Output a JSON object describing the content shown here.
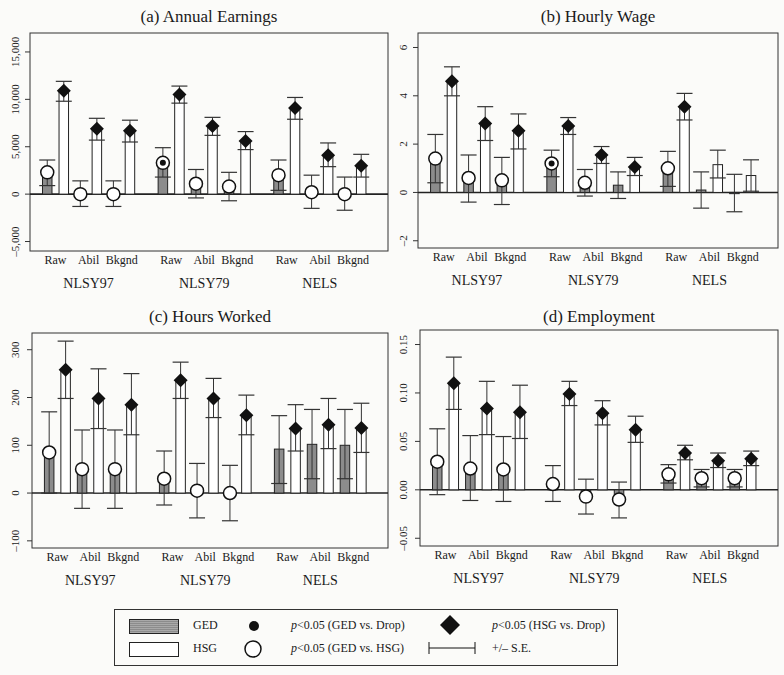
{
  "chart_data": [
    {
      "type": "bar",
      "title": "(a) Annual Earnings",
      "ylabel": "",
      "ylim": [
        -6000,
        17000
      ],
      "yticks": [
        -5000,
        0,
        5000,
        10000,
        15000
      ],
      "ytick_labels": [
        "-5,000",
        "0",
        "5,000",
        "10,000",
        "15,000"
      ],
      "groups": [
        "NLSY97",
        "NLSY79",
        "NELS"
      ],
      "categories": [
        "Raw",
        "Abil",
        "Bkgnd"
      ],
      "series": [
        {
          "name": "GED",
          "values": [
            [
              2300,
              0,
              0
            ],
            [
              3300,
              1100,
              800
            ],
            [
              2000,
              200,
              0
            ]
          ],
          "se_low": [
            [
              900,
              -1300,
              -1300
            ],
            [
              1800,
              -400,
              -700
            ],
            [
              400,
              -1500,
              -1700
            ]
          ],
          "se_high": [
            [
              3600,
              1400,
              1400
            ],
            [
              4900,
              2600,
              2300
            ],
            [
              3600,
              2000,
              1800
            ]
          ],
          "marker": [
            [
              "circle",
              "circle",
              "circle"
            ],
            [
              "dot",
              "circle",
              "circle"
            ],
            [
              "circle",
              "circle",
              "circle"
            ]
          ]
        },
        {
          "name": "HSG",
          "values": [
            [
              10900,
              6900,
              6700
            ],
            [
              10500,
              7200,
              5600
            ],
            [
              9100,
              4100,
              3000
            ]
          ],
          "se_low": [
            [
              9800,
              5700,
              5500
            ],
            [
              9600,
              6200,
              4700
            ],
            [
              7900,
              2900,
              1800
            ]
          ],
          "se_high": [
            [
              11900,
              8000,
              7800
            ],
            [
              11400,
              8100,
              6600
            ],
            [
              10200,
              5400,
              4200
            ]
          ],
          "marker": [
            [
              "diamond",
              "diamond",
              "diamond"
            ],
            [
              "diamond",
              "diamond",
              "diamond"
            ],
            [
              "diamond",
              "diamond",
              "diamond"
            ]
          ]
        }
      ]
    },
    {
      "type": "bar",
      "title": "(b) Hourly Wage",
      "ylabel": "",
      "ylim": [
        -2.3,
        6.6
      ],
      "yticks": [
        -2,
        0,
        2,
        4,
        6
      ],
      "ytick_labels": [
        "-2",
        "0",
        "2",
        "4",
        "6"
      ],
      "groups": [
        "NLSY97",
        "NLSY79",
        "NELS"
      ],
      "categories": [
        "Raw",
        "Abil",
        "Bkgnd"
      ],
      "series": [
        {
          "name": "GED",
          "values": [
            [
              1.4,
              0.6,
              0.5
            ],
            [
              1.2,
              0.4,
              0.3
            ],
            [
              1.0,
              0.1,
              -0.05
            ]
          ],
          "se_low": [
            [
              0.4,
              -0.4,
              -0.5
            ],
            [
              0.65,
              -0.15,
              -0.25
            ],
            [
              0.25,
              -0.65,
              -0.8
            ]
          ],
          "se_high": [
            [
              2.4,
              1.55,
              1.45
            ],
            [
              1.75,
              0.95,
              0.85
            ],
            [
              1.7,
              0.85,
              0.75
            ]
          ],
          "marker": [
            [
              "circle",
              "circle",
              "circle"
            ],
            [
              "dot",
              "circle",
              "none"
            ],
            [
              "circle",
              "none",
              "none"
            ]
          ]
        },
        {
          "name": "HSG",
          "values": [
            [
              4.6,
              2.85,
              2.55
            ],
            [
              2.75,
              1.55,
              1.05
            ],
            [
              3.55,
              1.15,
              0.7
            ]
          ],
          "se_low": [
            [
              4.0,
              2.15,
              1.8
            ],
            [
              2.4,
              1.2,
              0.7
            ],
            [
              3.0,
              0.6,
              0.05
            ]
          ],
          "se_high": [
            [
              5.2,
              3.55,
              3.25
            ],
            [
              3.1,
              1.9,
              1.45
            ],
            [
              4.1,
              1.75,
              1.35
            ]
          ],
          "marker": [
            [
              "diamond",
              "diamond",
              "diamond"
            ],
            [
              "diamond",
              "diamond",
              "diamond"
            ],
            [
              "diamond",
              "none",
              "none"
            ]
          ]
        }
      ]
    },
    {
      "type": "bar",
      "title": "(c) Hours Worked",
      "ylabel": "",
      "ylim": [
        -115,
        335
      ],
      "yticks": [
        -100,
        0,
        100,
        200,
        300
      ],
      "ytick_labels": [
        "-100",
        "0",
        "100",
        "200",
        "300"
      ],
      "groups": [
        "NLSY97",
        "NLSY79",
        "NELS"
      ],
      "categories": [
        "Raw",
        "Abil",
        "Bkgnd"
      ],
      "series": [
        {
          "name": "GED",
          "values": [
            [
              85,
              50,
              50
            ],
            [
              30,
              5,
              0
            ],
            [
              92,
              102,
              100
            ]
          ],
          "se_low": [
            [
              0,
              -32,
              -32
            ],
            [
              -25,
              -52,
              -58
            ],
            [
              20,
              30,
              30
            ]
          ],
          "se_high": [
            [
              170,
              132,
              132
            ],
            [
              88,
              62,
              58
            ],
            [
              162,
              175,
              175
            ]
          ],
          "marker": [
            [
              "circle",
              "circle",
              "circle"
            ],
            [
              "circle",
              "circle",
              "circle"
            ],
            [
              "none",
              "none",
              "none"
            ]
          ]
        },
        {
          "name": "HSG",
          "values": [
            [
              258,
              198,
              185
            ],
            [
              236,
              198,
              163
            ],
            [
              135,
              143,
              136
            ]
          ],
          "se_low": [
            [
              198,
              135,
              122
            ],
            [
              198,
              158,
              122
            ],
            [
              88,
              93,
              85
            ]
          ],
          "se_high": [
            [
              318,
              260,
              250
            ],
            [
              274,
              240,
              205
            ],
            [
              185,
              198,
              188
            ]
          ],
          "marker": [
            [
              "diamond",
              "diamond",
              "diamond"
            ],
            [
              "diamond",
              "diamond",
              "diamond"
            ],
            [
              "diamond",
              "diamond",
              "diamond"
            ]
          ]
        }
      ]
    },
    {
      "type": "bar",
      "title": "(d) Employment",
      "ylabel": "",
      "ylim": [
        -0.058,
        0.165
      ],
      "yticks": [
        -0.05,
        0.0,
        0.05,
        0.1,
        0.15
      ],
      "ytick_labels": [
        "-0.05",
        "0.00",
        "0.05",
        "0.10",
        "0.15"
      ],
      "groups": [
        "NLSY97",
        "NLSY79",
        "NELS"
      ],
      "categories": [
        "Raw",
        "Abil",
        "Bkgnd"
      ],
      "series": [
        {
          "name": "GED",
          "values": [
            [
              0.029,
              0.022,
              0.021
            ],
            [
              0.006,
              -0.007,
              -0.01
            ],
            [
              0.016,
              0.012,
              0.012
            ]
          ],
          "se_low": [
            [
              -0.005,
              -0.011,
              -0.012
            ],
            [
              -0.012,
              -0.025,
              -0.029
            ],
            [
              0.007,
              0.003,
              0.003
            ]
          ],
          "se_high": [
            [
              0.063,
              0.056,
              0.055
            ],
            [
              0.025,
              0.011,
              0.008
            ],
            [
              0.026,
              0.021,
              0.021
            ]
          ],
          "marker": [
            [
              "circle",
              "circle",
              "circle"
            ],
            [
              "circle",
              "circle",
              "circle"
            ],
            [
              "circle",
              "circle",
              "circle"
            ]
          ]
        },
        {
          "name": "HSG",
          "values": [
            [
              0.11,
              0.084,
              0.08
            ],
            [
              0.099,
              0.079,
              0.062
            ],
            [
              0.038,
              0.03,
              0.032
            ]
          ],
          "se_low": [
            [
              0.083,
              0.057,
              0.053
            ],
            [
              0.087,
              0.067,
              0.049
            ],
            [
              0.031,
              0.023,
              0.025
            ]
          ],
          "se_high": [
            [
              0.137,
              0.112,
              0.108
            ],
            [
              0.112,
              0.092,
              0.076
            ],
            [
              0.046,
              0.038,
              0.04
            ]
          ],
          "marker": [
            [
              "diamond",
              "diamond",
              "diamond"
            ],
            [
              "diamond",
              "diamond",
              "diamond"
            ],
            [
              "diamond",
              "diamond",
              "diamond"
            ]
          ]
        }
      ]
    }
  ],
  "legend": {
    "ged_label": "GED",
    "hsg_label": "HSG",
    "dot_label_p": "p",
    "dot_label_rest": "<0.05 (GED vs. Drop)",
    "circle_label_p": "p",
    "circle_label_rest": "<0.05 (GED vs. HSG)",
    "diamond_label_p": "p",
    "diamond_label_rest": "<0.05 (HSG vs. Drop)",
    "se_label": "+/– S.E."
  },
  "colors": {
    "ged_fill": "#8c8c8c",
    "hsg_fill": "#ffffff",
    "ink": "#1a1a1a",
    "background": "#fbfbf9"
  }
}
